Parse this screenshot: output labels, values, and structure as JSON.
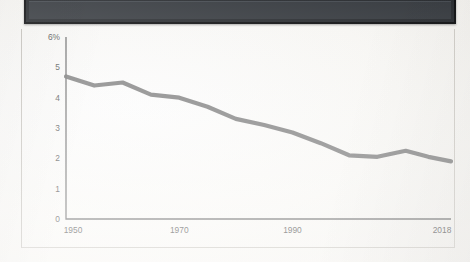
{
  "page": {
    "background_color": "#fbfaf7",
    "header_bar": {
      "color": "#2c2f33",
      "label": ""
    }
  },
  "chart_panel": {
    "border_color": "#c9c6c0"
  },
  "chart_data": {
    "type": "line",
    "title": "",
    "subtitle": "",
    "xlabel": "",
    "ylabel": "",
    "grid": false,
    "legend": null,
    "line_color": "#7a7a7a",
    "axis_color": "#6f6f6f",
    "xlim": [
      1950,
      2018
    ],
    "ylim": [
      0,
      6
    ],
    "x_tick_labels": [
      "1950",
      "1970",
      "1990",
      "2018"
    ],
    "x_ticks": [
      1950,
      1970,
      1990,
      2018
    ],
    "y_tick_labels": [
      "0",
      "1",
      "2",
      "3",
      "4",
      "5",
      "6%"
    ],
    "y_ticks": [
      0,
      1,
      2,
      3,
      4,
      5,
      6
    ],
    "x": [
      1950,
      1955,
      1960,
      1965,
      1970,
      1975,
      1980,
      1985,
      1990,
      1995,
      2000,
      2005,
      2010,
      2014,
      2018
    ],
    "values": [
      4.7,
      4.4,
      4.5,
      4.1,
      4.0,
      3.7,
      3.3,
      3.1,
      2.85,
      2.5,
      2.1,
      2.05,
      2.25,
      2.05,
      1.9
    ],
    "series": [
      {
        "name": "rate",
        "values": [
          4.7,
          4.4,
          4.5,
          4.1,
          4.0,
          3.7,
          3.3,
          3.1,
          2.85,
          2.5,
          2.1,
          2.05,
          2.25,
          2.05,
          1.9
        ]
      }
    ]
  }
}
